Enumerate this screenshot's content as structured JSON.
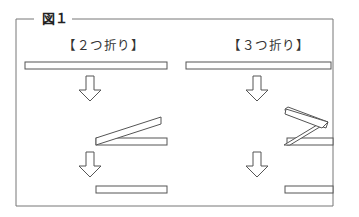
{
  "figure": {
    "title": "図１",
    "panels": [
      {
        "label": "【２つ折り】",
        "fold_type": "two-fold"
      },
      {
        "label": "【３つ折り】",
        "fold_type": "three-fold"
      }
    ]
  },
  "colors": {
    "stroke": "#555555",
    "frame": "#777777",
    "background": "#ffffff"
  }
}
